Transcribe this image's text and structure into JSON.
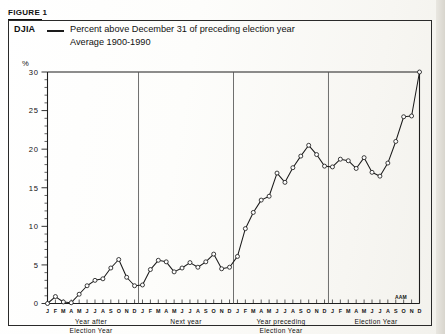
{
  "figure": {
    "label": "FIGURE 1"
  },
  "legend": {
    "series_name": "DJIA",
    "dash": "line-dash",
    "line1": "Percent above December 31 of preceding election year",
    "line2": "Average 1900-1990"
  },
  "axes": {
    "y_unit": "%",
    "y_ticks": [
      "0",
      "5",
      "10",
      "15",
      "20",
      "25",
      "30"
    ]
  },
  "annotations": {
    "aam": "AAM"
  },
  "period_captions": [
    {
      "line1": "Year after",
      "line2": "Election Year"
    },
    {
      "line1": "Next year",
      "line2": ""
    },
    {
      "line1": "Year preceding",
      "line2": "Election Year"
    },
    {
      "line1": "Election Year",
      "line2": ""
    }
  ],
  "chart_data": {
    "type": "line",
    "title": "Percent above December 31 of preceding election year",
    "subtitle": "Average 1900-1990",
    "series_label": "DJIA",
    "xlabel": "",
    "ylabel": "%",
    "ylim": [
      0,
      30
    ],
    "y_ticks": [
      0,
      5,
      10,
      15,
      20,
      25,
      30
    ],
    "grid": false,
    "legend_position": "top-left",
    "month_labels": [
      "J",
      "F",
      "M",
      "A",
      "M",
      "J",
      "J",
      "A",
      "S",
      "O",
      "N",
      "D"
    ],
    "periods": [
      "Year after Election Year",
      "Next year",
      "Year preceding Election Year",
      "Election Year"
    ],
    "x": [
      "Y1-J",
      "Y1-F",
      "Y1-M",
      "Y1-A",
      "Y1-M",
      "Y1-J",
      "Y1-J",
      "Y1-A",
      "Y1-S",
      "Y1-O",
      "Y1-N",
      "Y1-D",
      "Y2-J",
      "Y2-F",
      "Y2-M",
      "Y2-A",
      "Y2-M",
      "Y2-J",
      "Y2-J",
      "Y2-A",
      "Y2-S",
      "Y2-O",
      "Y2-N",
      "Y2-D",
      "Y3-J",
      "Y3-F",
      "Y3-M",
      "Y3-A",
      "Y3-M",
      "Y3-J",
      "Y3-J",
      "Y3-A",
      "Y3-S",
      "Y3-O",
      "Y3-N",
      "Y3-D",
      "Y4-J",
      "Y4-F",
      "Y4-M",
      "Y4-A",
      "Y4-M",
      "Y4-J",
      "Y4-J",
      "Y4-A",
      "Y4-S",
      "Y4-O",
      "Y4-N",
      "Y4-D"
    ],
    "values": [
      0.0,
      0.9,
      0.2,
      0.1,
      1.2,
      2.3,
      3.0,
      3.2,
      4.6,
      5.7,
      3.4,
      2.3,
      2.4,
      4.4,
      5.6,
      5.4,
      4.1,
      4.6,
      5.3,
      4.7,
      5.4,
      6.4,
      4.5,
      4.7,
      6.1,
      9.7,
      11.8,
      13.4,
      13.9,
      16.9,
      15.7,
      17.6,
      19.1,
      20.5,
      19.3,
      17.8,
      17.7,
      18.7,
      18.5,
      17.5,
      18.9,
      17.0,
      16.5,
      18.2,
      21.0,
      24.2,
      24.3,
      30.0
    ]
  }
}
